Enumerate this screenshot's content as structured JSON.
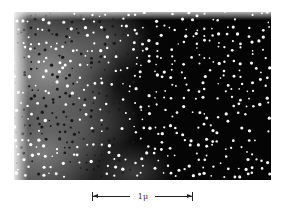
{
  "figure": {
    "type": "micrograph",
    "colors": {
      "background": "#ffffff",
      "field": "#050505",
      "particles": "#ffffff"
    }
  },
  "scale_bar": {
    "label": "1μ",
    "icon": "double-arrow-scale-bar-icon"
  }
}
